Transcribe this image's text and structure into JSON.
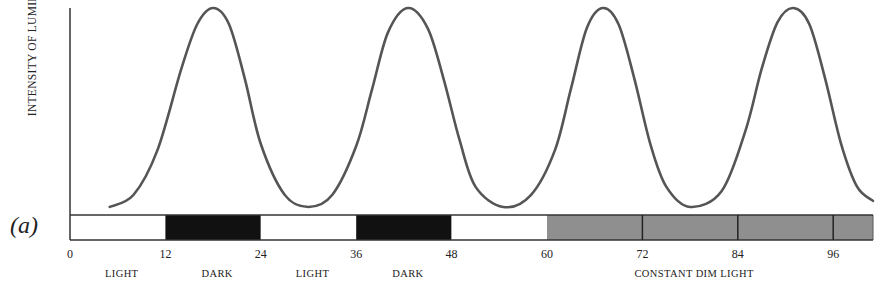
{
  "chart_data": {
    "type": "line",
    "title": "",
    "panel_label": "(a)",
    "xlabel": "Time (hours)",
    "ylabel": "INTENSITY OF LUMINESCENCE",
    "xlim": [
      0,
      101
    ],
    "ylim": [
      0,
      1
    ],
    "grid": false,
    "legend": null,
    "x_ticks": [
      0,
      12,
      24,
      36,
      48,
      60,
      72,
      84,
      96
    ],
    "x_tick_labels": [
      "0",
      "12",
      "24",
      "36",
      "48",
      "60",
      "72",
      "84",
      "96"
    ],
    "series": [
      {
        "name": "Luminescence",
        "color": "#555555",
        "x": [
          5,
          8,
          11,
          14,
          16,
          18,
          20,
          22,
          24,
          27,
          30,
          33,
          36,
          38,
          40,
          42.5,
          45,
          47,
          49,
          51,
          54.5,
          58,
          61,
          63,
          65,
          67,
          69,
          71,
          73,
          75,
          78,
          82,
          85,
          87,
          89,
          91,
          93,
          95,
          97,
          99,
          101
        ],
        "values": [
          0.02,
          0.08,
          0.3,
          0.7,
          0.92,
          1.0,
          0.92,
          0.65,
          0.33,
          0.08,
          0.02,
          0.08,
          0.32,
          0.6,
          0.88,
          1.0,
          0.9,
          0.65,
          0.35,
          0.12,
          0.02,
          0.08,
          0.3,
          0.6,
          0.9,
          1.0,
          0.92,
          0.65,
          0.33,
          0.12,
          0.02,
          0.1,
          0.4,
          0.7,
          0.93,
          1.0,
          0.92,
          0.65,
          0.33,
          0.12,
          0.05
        ]
      }
    ],
    "light_schedule": [
      {
        "start": 0,
        "end": 12,
        "condition": "LIGHT",
        "fill": "#ffffff"
      },
      {
        "start": 12,
        "end": 24,
        "condition": "DARK",
        "fill": "#111111"
      },
      {
        "start": 24,
        "end": 36,
        "condition": "LIGHT",
        "fill": "#ffffff"
      },
      {
        "start": 36,
        "end": 48,
        "condition": "DARK",
        "fill": "#111111"
      },
      {
        "start": 48,
        "end": 60,
        "condition": "LIGHT",
        "fill": "#ffffff"
      },
      {
        "start": 60,
        "end": 101,
        "condition": "CONSTANT DIM LIGHT",
        "fill": "#8f8f8f"
      }
    ],
    "phase_labels": [
      {
        "text": "LIGHT",
        "x": 6
      },
      {
        "text": "DARK",
        "x": 18
      },
      {
        "text": "LIGHT",
        "x": 30
      },
      {
        "text": "DARK",
        "x": 42
      },
      {
        "text": "CONSTANT DIM LIGHT",
        "x": 78
      }
    ]
  },
  "labels": {
    "ylabel": "INTENSITY OF LUMINESCENCE",
    "panel": "(a)"
  }
}
